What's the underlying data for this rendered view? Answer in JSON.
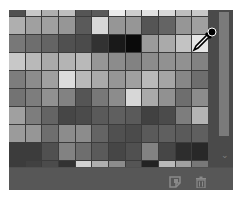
{
  "panel": {
    "name": "Swatches",
    "background": "#5a5a5a",
    "columns": 12
  },
  "swatches": [
    [
      "#505050",
      "#c8c8c8",
      "#afafaf",
      "#bebebe",
      "#555555",
      "#5a5a5a",
      "#ebebeb",
      "#cdcdcd",
      "#e1e1e1",
      "#d7d7d7",
      "#bebebe",
      "#c8c8c8"
    ],
    [
      "#afafaf",
      "#a0a0a0",
      "#a0a0a0",
      "#969696",
      "#5a5a5a",
      "#d7d7d7",
      "#969696",
      "#969696",
      "#555555",
      "#646464",
      "#969696",
      "#a0a0a0"
    ],
    [
      "#787878",
      "#6e6e6e",
      "#646464",
      "#505050",
      "#4b4b4b",
      "#323232",
      "#191919",
      "#0a0a0a",
      "#9b9b9b",
      "#aaaaaa",
      "#c3c3c3",
      "#e6e6e6"
    ],
    [
      "#c8c8c8",
      "#b9b9b9",
      "#aaaaaa",
      "#b4b4b4",
      "#b9b9b9",
      "#969696",
      "#8c8c8c",
      "#828282",
      "#8c8c8c",
      "#919191",
      "#919191",
      "#828282"
    ],
    [
      "#7d7d7d",
      "#8c8c8c",
      "#a0a0a0",
      "#dcdcdc",
      "#b9b9b9",
      "#aaaaaa",
      "#969696",
      "#a0a0a0",
      "#b9b9b9",
      "#a5a5a5",
      "#878787",
      "#6e6e6e"
    ],
    [
      "#737373",
      "#7d7d7d",
      "#919191",
      "#828282",
      "#555555",
      "#787878",
      "#8c8c8c",
      "#d7d7d7",
      "#aaaaaa",
      "#919191",
      "#6e6e6e",
      "#8c8c8c"
    ],
    [
      "#a0a0a0",
      "#7d7d7d",
      "#646464",
      "#464646",
      "#4b4b4b",
      "#5a5a5a",
      "#5f5f5f",
      "#5a5a5a",
      "#414141",
      "#4b4b4b",
      "#7d7d7d",
      "#b4b4b4"
    ],
    [
      "#9b9b9b",
      "#969696",
      "#6e6e6e",
      "#8c8c8c",
      "#8c8c8c",
      "#646464",
      "#505050",
      "#4b4b4b",
      "#5a5a5a",
      "#5f5f5f",
      "#5a5a5a",
      "#5f5f5f"
    ],
    [
      "#3c3c3c",
      "#3c3c3c",
      "#505050",
      "#828282",
      "#6e6e6e",
      "#5a5a5a",
      "#464646",
      "#505050",
      "#828282",
      "#464646",
      "#2d2d2d",
      "#282828"
    ],
    [
      "#3c3c3c",
      "#414141",
      "#4b4b4b",
      "#323232",
      "#d2d2d2",
      "#afafaf",
      "#8c8c8c",
      "#555555",
      "#232323",
      "#b9b9b9",
      "#a0a0a0",
      "#787878"
    ]
  ],
  "cursor": {
    "type": "eyedropper-icon",
    "row": 2,
    "col": 11
  },
  "scrollbar": {
    "thumb_color": "#7a7a7a",
    "track_color": "#4a4a4a",
    "down_arrow": "⌄"
  },
  "footer": {
    "new_swatch_icon": "new-swatch-icon",
    "delete_icon": "trash-icon"
  }
}
